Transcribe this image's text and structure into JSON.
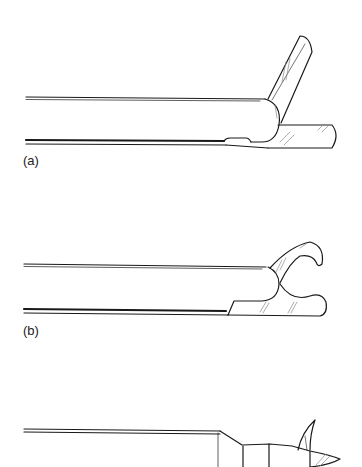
{
  "figure": {
    "panels": [
      {
        "id": "a",
        "label": "(a)",
        "description": "Instrument with single upper jaw opened at an angle, lower jaw fixed"
      },
      {
        "id": "b",
        "label": "(b)",
        "description": "Instrument with two curved jaws opened in a scissor/grasper configuration"
      },
      {
        "id": "c",
        "label": "",
        "description": "Instrument with tapered segmented tip and small hooked prong"
      }
    ],
    "colors": {
      "stroke": "#1a1a1a",
      "background": "#ffffff",
      "hatch": "#888888"
    }
  }
}
